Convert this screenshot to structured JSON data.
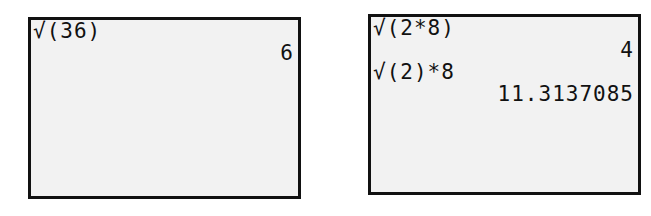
{
  "screens": [
    {
      "lines": [
        {
          "type": "expression",
          "text": "√(36)"
        },
        {
          "type": "result",
          "text": "6"
        }
      ]
    },
    {
      "lines": [
        {
          "type": "expression",
          "text": "√(2*8)"
        },
        {
          "type": "result",
          "text": "4"
        },
        {
          "type": "expression",
          "text": "√(2)*8"
        },
        {
          "type": "result",
          "text": "11.3137085"
        }
      ]
    }
  ],
  "colors": {
    "screen_background": "#f2f2f2",
    "text": "#111111",
    "border": "#111111"
  }
}
